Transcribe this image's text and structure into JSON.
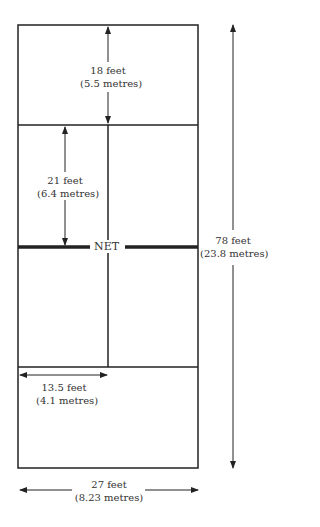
{
  "diagram": {
    "net_label": "NET",
    "dimensions": [
      {
        "id": "rear_service",
        "feet": "18 feet",
        "metres": "(5.5 metres)"
      },
      {
        "id": "front_service",
        "feet": "21 feet",
        "metres": "(6.4 metres)"
      },
      {
        "id": "court_length",
        "feet": "78 feet",
        "metres": "(23.8 metres)"
      },
      {
        "id": "half_width",
        "feet": "13.5 feet",
        "metres": "(4.1 metres)"
      },
      {
        "id": "court_width",
        "feet": "27 feet",
        "metres": "(8.23 metres)"
      }
    ],
    "caption_partial": "",
    "colors": {
      "line": "#222222",
      "background": "#ffffff"
    }
  }
}
